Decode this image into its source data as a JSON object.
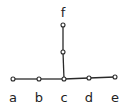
{
  "diagram": {
    "type": "tree-graph",
    "nodes": [
      {
        "id": "a",
        "label": "a",
        "x": 13,
        "y": 79,
        "lx": 13,
        "ly": 102
      },
      {
        "id": "b",
        "label": "b",
        "x": 39,
        "y": 79,
        "lx": 39,
        "ly": 102
      },
      {
        "id": "c",
        "label": "c",
        "x": 64,
        "y": 79,
        "lx": 64,
        "ly": 102
      },
      {
        "id": "d",
        "label": "d",
        "x": 89,
        "y": 78,
        "lx": 89,
        "ly": 102
      },
      {
        "id": "e",
        "label": "e",
        "x": 115,
        "y": 77,
        "lx": 115,
        "ly": 102
      },
      {
        "id": "m",
        "label": "",
        "x": 63,
        "y": 52
      },
      {
        "id": "f",
        "label": "f",
        "x": 63,
        "y": 25,
        "lx": 63,
        "ly": 17
      }
    ],
    "edges": [
      [
        "a",
        "b"
      ],
      [
        "b",
        "c"
      ],
      [
        "c",
        "d"
      ],
      [
        "d",
        "e"
      ],
      [
        "c",
        "m"
      ],
      [
        "m",
        "f"
      ]
    ]
  }
}
